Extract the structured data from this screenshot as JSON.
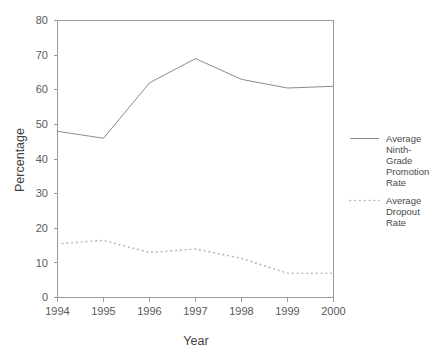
{
  "chart_data": {
    "type": "line",
    "title": "",
    "xlabel": "Year",
    "ylabel": "Percentage",
    "categories": [
      "1994",
      "1995",
      "1996",
      "1997",
      "1998",
      "1999",
      "2000"
    ],
    "x": [
      1994,
      1995,
      1996,
      1997,
      1998,
      1999,
      2000
    ],
    "xlim": [
      1994,
      2000
    ],
    "ylim": [
      0,
      80
    ],
    "y_ticks": [
      0,
      10,
      20,
      30,
      40,
      50,
      60,
      70,
      80
    ],
    "y_tick_labels": [
      "0",
      "10",
      "20",
      "30",
      "40",
      "50",
      "60",
      "70",
      "80"
    ],
    "x_tick_labels": [
      "1994",
      "1995",
      "1996",
      "1997",
      "1998",
      "1999",
      "2000"
    ],
    "grid": false,
    "legend_position": "right",
    "series": [
      {
        "name": "Average Ninth-Grade Promotion Rate",
        "style": "solid",
        "color": "#8c8c8c",
        "values": [
          48,
          46,
          62,
          69,
          63,
          60.5,
          61
        ]
      },
      {
        "name": "Average Dropout Rate",
        "style": "dotted",
        "color": "#b5b5b5",
        "values": [
          15.5,
          16.5,
          13,
          14,
          11.3,
          7,
          7
        ]
      }
    ]
  },
  "axis": {
    "y_title": "Percentage",
    "x_title": "Year",
    "y_labels": [
      "80",
      "70",
      "60",
      "50",
      "40",
      "30",
      "20",
      "10",
      "0"
    ],
    "x_labels": [
      "1994",
      "1995",
      "1996",
      "1997",
      "1998",
      "1999",
      "2000"
    ]
  },
  "legend": {
    "items": [
      {
        "label": "Average Ninth-Grade Promotion Rate",
        "lines": [
          "Average",
          "Ninth-",
          "Grade",
          "Promotion",
          "Rate"
        ],
        "style": "solid"
      },
      {
        "label": "Average Dropout Rate",
        "lines": [
          "Average",
          "Dropout",
          "Rate"
        ],
        "style": "dotted"
      }
    ]
  },
  "colors": {
    "background": "#ffffff",
    "axis": "#9a9a9a",
    "series_solid": "#8c8c8c",
    "series_dotted": "#b5b5b5",
    "text": "#4a4a4a"
  }
}
